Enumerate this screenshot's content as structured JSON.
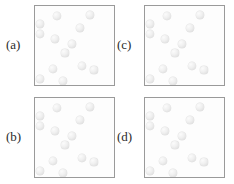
{
  "figure": {
    "type": "diagram",
    "background_color": "#ffffff",
    "box_border_color": "#9a9a9a",
    "box_fill_color": "#fdfdfd",
    "dot_color": "#ececec",
    "dot_highlight_color": "#fbfbfb",
    "dot_shadow_color": "#d6d6d6"
  },
  "panels": [
    {
      "id": "a",
      "label": "(a)",
      "label_x": 6,
      "label_y": 38,
      "box_x": 34,
      "box_y": 5,
      "dot_count": 13,
      "dots": [
        {
          "x": 22,
          "y": 10,
          "r": 4.0
        },
        {
          "x": 55,
          "y": 9,
          "r": 3.8
        },
        {
          "x": 5,
          "y": 18,
          "r": 3.8
        },
        {
          "x": 45,
          "y": 22,
          "r": 3.8
        },
        {
          "x": 5,
          "y": 28,
          "r": 4.0
        },
        {
          "x": 20,
          "y": 33,
          "r": 3.8
        },
        {
          "x": 37,
          "y": 38,
          "r": 3.8
        },
        {
          "x": 30,
          "y": 47,
          "r": 3.6
        },
        {
          "x": 18,
          "y": 63,
          "r": 4.0
        },
        {
          "x": 47,
          "y": 60,
          "r": 4.0
        },
        {
          "x": 59,
          "y": 64,
          "r": 3.6
        },
        {
          "x": 5,
          "y": 73,
          "r": 3.8
        },
        {
          "x": 28,
          "y": 75,
          "r": 3.8
        }
      ]
    },
    {
      "id": "b",
      "label": "(b)",
      "label_x": 6,
      "label_y": 130,
      "box_x": 34,
      "box_y": 97,
      "dot_count": 13,
      "dots": [
        {
          "x": 22,
          "y": 10,
          "r": 4.0
        },
        {
          "x": 55,
          "y": 9,
          "r": 3.8
        },
        {
          "x": 5,
          "y": 18,
          "r": 3.8
        },
        {
          "x": 45,
          "y": 22,
          "r": 3.8
        },
        {
          "x": 5,
          "y": 28,
          "r": 4.0
        },
        {
          "x": 20,
          "y": 33,
          "r": 3.8
        },
        {
          "x": 37,
          "y": 38,
          "r": 3.8
        },
        {
          "x": 30,
          "y": 47,
          "r": 3.6
        },
        {
          "x": 18,
          "y": 63,
          "r": 4.0
        },
        {
          "x": 47,
          "y": 60,
          "r": 4.0
        },
        {
          "x": 59,
          "y": 64,
          "r": 3.6
        },
        {
          "x": 5,
          "y": 73,
          "r": 3.8
        },
        {
          "x": 28,
          "y": 75,
          "r": 3.8
        }
      ]
    },
    {
      "id": "c",
      "label": "(c)",
      "label_x": 117,
      "label_y": 38,
      "box_x": 144,
      "box_y": 5,
      "dot_count": 13,
      "dots": [
        {
          "x": 22,
          "y": 10,
          "r": 4.0
        },
        {
          "x": 55,
          "y": 9,
          "r": 3.8
        },
        {
          "x": 5,
          "y": 18,
          "r": 3.8
        },
        {
          "x": 45,
          "y": 22,
          "r": 3.8
        },
        {
          "x": 5,
          "y": 28,
          "r": 4.0
        },
        {
          "x": 20,
          "y": 33,
          "r": 3.8
        },
        {
          "x": 37,
          "y": 38,
          "r": 3.8
        },
        {
          "x": 30,
          "y": 47,
          "r": 3.6
        },
        {
          "x": 18,
          "y": 63,
          "r": 4.0
        },
        {
          "x": 47,
          "y": 60,
          "r": 4.0
        },
        {
          "x": 59,
          "y": 64,
          "r": 3.6
        },
        {
          "x": 5,
          "y": 73,
          "r": 3.8
        },
        {
          "x": 28,
          "y": 75,
          "r": 3.8
        }
      ]
    },
    {
      "id": "d",
      "label": "(d)",
      "label_x": 117,
      "label_y": 130,
      "box_x": 144,
      "box_y": 97,
      "dot_count": 13,
      "dots": [
        {
          "x": 22,
          "y": 10,
          "r": 4.0
        },
        {
          "x": 55,
          "y": 9,
          "r": 3.8
        },
        {
          "x": 5,
          "y": 18,
          "r": 3.8
        },
        {
          "x": 45,
          "y": 22,
          "r": 3.8
        },
        {
          "x": 5,
          "y": 28,
          "r": 4.0
        },
        {
          "x": 20,
          "y": 33,
          "r": 3.8
        },
        {
          "x": 37,
          "y": 38,
          "r": 3.8
        },
        {
          "x": 30,
          "y": 47,
          "r": 3.6
        },
        {
          "x": 18,
          "y": 63,
          "r": 4.0
        },
        {
          "x": 47,
          "y": 60,
          "r": 4.0
        },
        {
          "x": 59,
          "y": 64,
          "r": 3.6
        },
        {
          "x": 5,
          "y": 73,
          "r": 3.8
        },
        {
          "x": 28,
          "y": 75,
          "r": 3.8
        }
      ]
    }
  ]
}
